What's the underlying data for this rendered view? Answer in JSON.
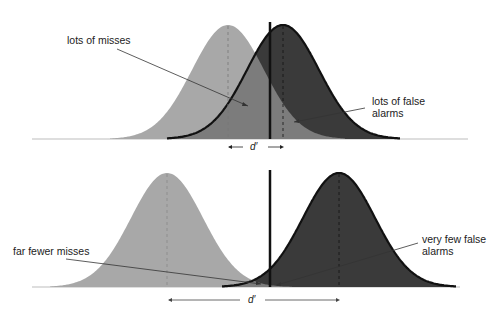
{
  "figure": {
    "title": "",
    "colors": {
      "noise_fill": "#a8a8a8",
      "signal_fill": "#3a3a3a",
      "overlap_fill": "#7c7c7c",
      "outline": "#111111",
      "baseline": "#bdbdbd",
      "annotation_line": "#333333"
    },
    "panels": [
      {
        "id": "top",
        "description": "Small separation between noise and signal distributions",
        "noise_peak_x": 228,
        "signal_peak_x": 283,
        "criterion_x": 270,
        "annotations": {
          "misses": "lots of misses",
          "false_alarms": "lots of false\nalarms"
        },
        "dprime_label": "d′",
        "dprime_arrow_left": "←",
        "dprime_arrow_right": "→"
      },
      {
        "id": "bottom",
        "description": "Large separation between noise and signal distributions",
        "noise_peak_x": 167,
        "signal_peak_x": 339,
        "criterion_x": 270,
        "annotations": {
          "misses": "far fewer misses",
          "false_alarms": "very few false\nalarms"
        },
        "dprime_label": "d′"
      }
    ]
  }
}
